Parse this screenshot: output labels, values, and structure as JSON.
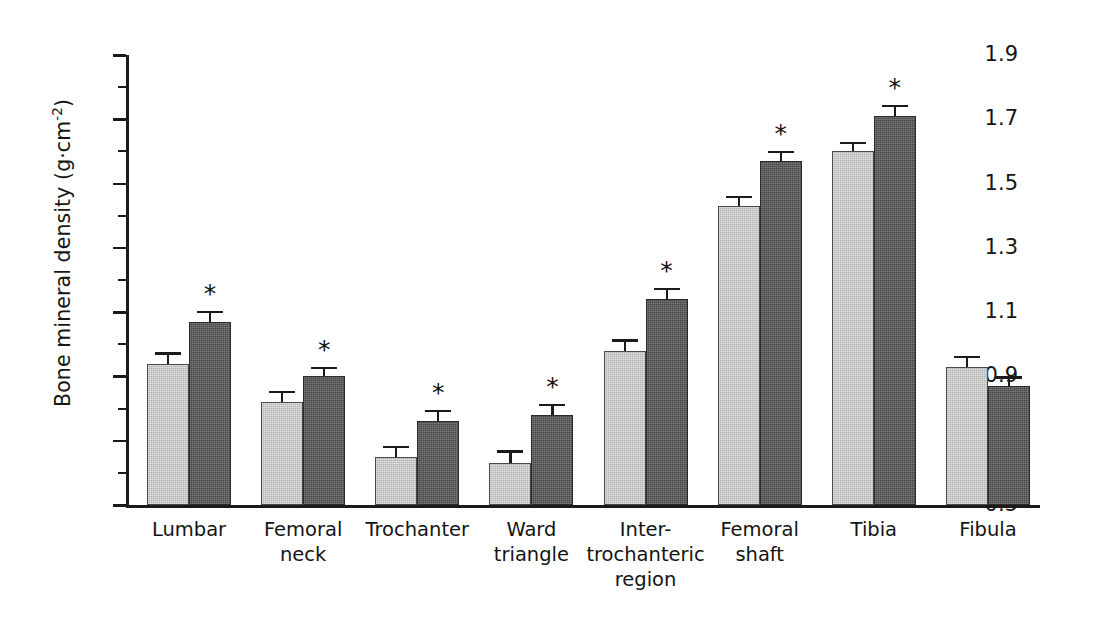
{
  "chart_data": {
    "type": "bar",
    "title": "",
    "xlabel": "",
    "ylabel": "Bone mineral density (g·cm",
    "ylabel_sup": "-2",
    "ylabel_tail": ")",
    "ylim": [
      0.5,
      1.9
    ],
    "ytick_step": 0.2,
    "yminor_step": 0.1,
    "grid": false,
    "legend": "none",
    "ytick_labels": [
      "1.9",
      "1.7",
      "1.5",
      "1.3",
      "1.1",
      "0.9",
      "0.7",
      "0.5"
    ],
    "ytick_values": [
      1.9,
      1.7,
      1.5,
      1.3,
      1.1,
      0.9,
      0.7,
      0.5
    ],
    "categories": [
      "Lumbar",
      "Femoral neck",
      "Trochanter",
      "Ward triangle",
      "Inter-trochanteric region",
      "Femoral shaft",
      "Tibia",
      "Fibula"
    ],
    "category_lines": [
      [
        "Lumbar"
      ],
      [
        "Femoral",
        "neck"
      ],
      [
        "Trochanter"
      ],
      [
        "Ward",
        "triangle"
      ],
      [
        "Inter-",
        "trochanteric",
        "region"
      ],
      [
        "Femoral",
        "shaft"
      ],
      [
        "Tibia"
      ],
      [
        "Fibula"
      ]
    ],
    "series": [
      {
        "name": "light",
        "color": "#b3b3b3",
        "values": [
          0.94,
          0.82,
          0.65,
          0.63,
          0.98,
          1.43,
          1.6,
          0.93
        ],
        "errors": [
          0.035,
          0.035,
          0.035,
          0.04,
          0.035,
          0.032,
          0.03,
          0.035
        ],
        "significant": [
          false,
          false,
          false,
          false,
          false,
          false,
          false,
          false
        ]
      },
      {
        "name": "dark",
        "color": "#474747",
        "values": [
          1.07,
          0.9,
          0.76,
          0.78,
          1.14,
          1.57,
          1.71,
          0.87
        ],
        "errors": [
          0.035,
          0.03,
          0.035,
          0.035,
          0.035,
          0.032,
          0.035,
          0.03
        ],
        "significant": [
          true,
          true,
          true,
          true,
          true,
          true,
          true,
          false
        ]
      }
    ],
    "significance_marker": "*"
  },
  "axis": {
    "line_color": "#1b1b1b"
  }
}
